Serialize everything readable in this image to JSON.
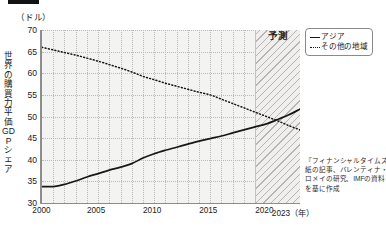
{
  "header": {
    "marker_bar": "",
    "unit_label": "（ドル）"
  },
  "axis": {
    "y_title": "世界の購買力平価GDPシェア",
    "y_ticks": [
      "70",
      "65",
      "60",
      "55",
      "50",
      "45",
      "40",
      "35",
      "30"
    ],
    "x_ticks": [
      "2000",
      "2005",
      "2010",
      "2015",
      "2020",
      "2023（年）"
    ]
  },
  "forecast": {
    "label": "予測",
    "start_year": 2019
  },
  "legend": {
    "items": [
      {
        "label": "アジア",
        "style": "solid"
      },
      {
        "label": "その他の地域",
        "style": "dotted"
      }
    ]
  },
  "source_note": {
    "lines": [
      "『フィナンシャルタイムズ』",
      "紙の記事、バレンティナ・",
      "ロメイの研究、IMFの資料",
      "を基に作成"
    ]
  },
  "chart_data": {
    "type": "line",
    "title": "",
    "subtitle": "",
    "xlabel": "2023（年）",
    "ylabel": "世界の購買力平価GDPシェア",
    "unit": "（ドル）",
    "xlim": [
      2000,
      2023
    ],
    "ylim": [
      30,
      70
    ],
    "yticks": [
      30,
      35,
      40,
      45,
      50,
      55,
      60,
      65,
      70
    ],
    "xticks": [
      2000,
      2005,
      2010,
      2015,
      2020,
      2023
    ],
    "grid": true,
    "legend_position": "top-right-outside",
    "annotations": [
      {
        "text": "予測",
        "x_range": [
          2019,
          2023
        ],
        "type": "hatched-band"
      }
    ],
    "x": [
      2000,
      2001,
      2002,
      2003,
      2004,
      2005,
      2006,
      2007,
      2008,
      2009,
      2010,
      2011,
      2012,
      2013,
      2014,
      2015,
      2016,
      2017,
      2018,
      2019,
      2020,
      2021,
      2022,
      2023
    ],
    "series": [
      {
        "name": "アジア",
        "style": "solid",
        "color": "#171717",
        "values": [
          33.8,
          33.8,
          34.3,
          35.1,
          36.0,
          36.8,
          37.6,
          38.3,
          39.1,
          40.4,
          41.4,
          42.2,
          42.9,
          43.6,
          44.3,
          44.9,
          45.5,
          46.2,
          46.9,
          47.6,
          48.3,
          49.3,
          50.4,
          51.7
        ]
      },
      {
        "name": "その他の地域",
        "style": "dotted",
        "color": "#171717",
        "values": [
          66.0,
          65.4,
          64.8,
          64.2,
          63.5,
          62.8,
          62.0,
          61.2,
          60.3,
          59.3,
          58.5,
          57.7,
          57.0,
          56.3,
          55.6,
          55.0,
          54.0,
          53.0,
          52.0,
          51.0,
          50.0,
          49.0,
          47.9,
          46.9
        ]
      }
    ]
  }
}
